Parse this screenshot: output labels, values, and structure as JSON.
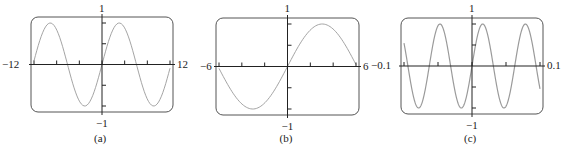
{
  "chart_data": [
    {
      "type": "line",
      "panel": "(a)",
      "caption": "(a)",
      "function_plotted": "y = sin(100x) (aliased, sampled at screen resolution)",
      "xlim": [
        -12,
        12
      ],
      "ylim": [
        -1,
        1
      ],
      "x_tick_labels": {
        "left": "−12",
        "right": "12"
      },
      "y_tick_labels": {
        "top": "1",
        "bottom": "−1"
      },
      "x_ticks": [
        -12,
        -8,
        -4,
        0,
        4,
        8,
        12
      ],
      "y_ticks": [
        -1,
        -0.5,
        0.5,
        1
      ],
      "grid": false,
      "line_color": "#9a9a9a",
      "omega": 100
    },
    {
      "type": "line",
      "panel": "(b)",
      "caption": "(b)",
      "function_plotted": "y = sin(100x) (aliased, sampled at screen resolution)",
      "xlim": [
        -6,
        6
      ],
      "ylim": [
        -1,
        1
      ],
      "x_tick_labels": {
        "left": "−6",
        "right": "6"
      },
      "y_tick_labels": {
        "top": "1",
        "bottom": "−1"
      },
      "x_ticks": [
        -6,
        -4,
        -2,
        0,
        2,
        4,
        6
      ],
      "y_ticks": [
        -1,
        -0.5,
        0.5,
        1
      ],
      "grid": false,
      "line_color": "#9a9a9a",
      "omega": 100
    },
    {
      "type": "line",
      "panel": "(c)",
      "caption": "(c)",
      "function_plotted": "y = sin(100x)",
      "xlim": [
        -0.1,
        0.1
      ],
      "ylim": [
        -1,
        1
      ],
      "x_tick_labels": {
        "left": "−0.1",
        "right": "0.1"
      },
      "y_tick_labels": {
        "top": "1",
        "bottom": "−1"
      },
      "x_ticks": [
        -0.1,
        -0.05,
        0,
        0.05,
        0.1
      ],
      "y_ticks": [
        -1,
        -0.5,
        0.5,
        1
      ],
      "grid": false,
      "line_color": "#9a9a9a",
      "omega": 100
    }
  ],
  "panels": [
    {
      "box": {
        "x": 31,
        "y": 17,
        "w": 142,
        "h": 95
      },
      "samples": 95,
      "label_left_x": 2,
      "label_right_x": 177
    },
    {
      "box": {
        "x": 216,
        "y": 18,
        "w": 143,
        "h": 97
      },
      "samples": 95,
      "label_left_x": 200,
      "label_right_x": 363
    },
    {
      "box": {
        "x": 401,
        "y": 18,
        "w": 142,
        "h": 96
      },
      "samples": 400,
      "label_left_x": 371,
      "label_right_x": 547
    }
  ],
  "colors": {
    "frame": "#555555",
    "axis": "#222222",
    "curve": "#9a9a9a"
  }
}
